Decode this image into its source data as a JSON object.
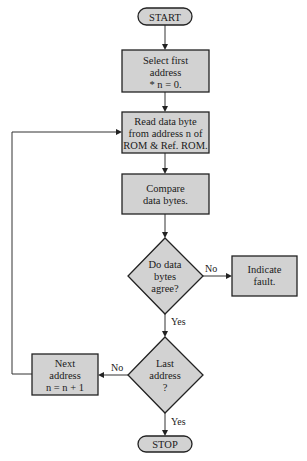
{
  "diagram": {
    "type": "flowchart",
    "colors": {
      "fill": "#d2d2d2",
      "stroke": "#222222",
      "background": "#ffffff"
    },
    "nodes": {
      "start": {
        "shape": "terminal",
        "label": "START"
      },
      "select_first": {
        "shape": "process",
        "lines": [
          "Select first",
          "address",
          "* n = 0."
        ]
      },
      "read_byte": {
        "shape": "process",
        "lines": [
          "Read data byte",
          "from address n of",
          "ROM & Ref. ROM."
        ]
      },
      "compare": {
        "shape": "process",
        "lines": [
          "Compare",
          "data bytes."
        ]
      },
      "agree": {
        "shape": "decision",
        "lines": [
          "Do data",
          "bytes",
          "agree?"
        ]
      },
      "fault": {
        "shape": "process",
        "lines": [
          "Indicate",
          "fault."
        ]
      },
      "last": {
        "shape": "decision",
        "lines": [
          "Last",
          "address",
          "?"
        ]
      },
      "next": {
        "shape": "process",
        "lines": [
          "Next",
          "address",
          "n = n + 1"
        ]
      },
      "stop": {
        "shape": "terminal",
        "label": "STOP"
      }
    },
    "edges": {
      "agree_no": "No",
      "agree_yes": "Yes",
      "last_no": "No",
      "last_yes": "Yes"
    }
  }
}
